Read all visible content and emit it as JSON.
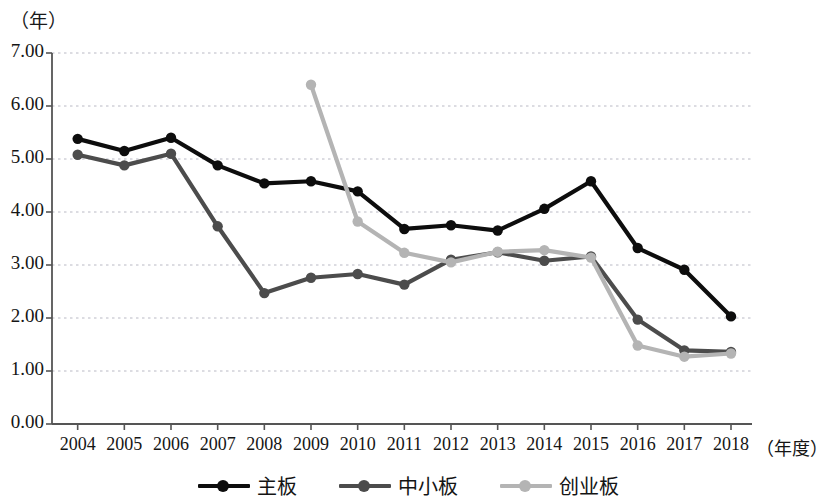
{
  "axis": {
    "y_unit_label": "（年）",
    "x_unit_label": "（年度）",
    "y_ticks": [
      "0.00",
      "1.00",
      "2.00",
      "3.00",
      "4.00",
      "5.00",
      "6.00",
      "7.00"
    ],
    "x_ticks": [
      "2004",
      "2005",
      "2006",
      "2007",
      "2008",
      "2009",
      "2010",
      "2011",
      "2012",
      "2013",
      "2014",
      "2015",
      "2016",
      "2017",
      "2018"
    ]
  },
  "legend": {
    "items": [
      {
        "label": "主板",
        "color": "#0d0d0d"
      },
      {
        "label": "中小板",
        "color": "#4c4c4c"
      },
      {
        "label": "创业板",
        "color": "#b4b4b4"
      }
    ]
  },
  "chart_data": {
    "type": "line",
    "title": "",
    "xlabel": "（年度）",
    "ylabel": "（年）",
    "ylim": [
      0,
      7
    ],
    "ytick_step": 1,
    "grid": true,
    "legend_position": "bottom",
    "categories": [
      "2004",
      "2005",
      "2006",
      "2007",
      "2008",
      "2009",
      "2010",
      "2011",
      "2012",
      "2013",
      "2014",
      "2015",
      "2016",
      "2017",
      "2018"
    ],
    "series": [
      {
        "name": "主板",
        "color": "#0d0d0d",
        "values": [
          5.38,
          5.15,
          5.4,
          4.88,
          4.54,
          4.58,
          4.39,
          3.68,
          3.75,
          3.65,
          4.06,
          4.58,
          3.32,
          2.91,
          2.03
        ]
      },
      {
        "name": "中小板",
        "color": "#4c4c4c",
        "values": [
          5.08,
          4.88,
          5.1,
          3.73,
          2.47,
          2.76,
          2.83,
          2.63,
          3.1,
          3.24,
          3.08,
          3.16,
          1.97,
          1.39,
          1.36
        ]
      },
      {
        "name": "创业板",
        "color": "#b4b4b4",
        "values": [
          null,
          null,
          null,
          null,
          null,
          6.4,
          3.82,
          3.23,
          3.05,
          3.25,
          3.28,
          3.14,
          1.48,
          1.27,
          1.33
        ]
      }
    ]
  }
}
